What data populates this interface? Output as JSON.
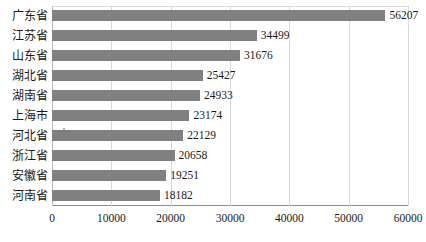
{
  "chart_data": {
    "type": "bar",
    "orientation": "horizontal",
    "title": "",
    "subtitle": "",
    "xlabel": "",
    "ylabel": "",
    "categories": [
      "广东省",
      "江苏省",
      "山东省",
      "湖北省",
      "湖南省",
      "上海市",
      "河北省",
      "浙江省",
      "安徽省",
      "河南省"
    ],
    "values": [
      56207,
      34499,
      31676,
      25427,
      24933,
      23174,
      22129,
      20658,
      19251,
      18182
    ],
    "data_labels": [
      "56207",
      "34499",
      "31676",
      "25427",
      "24933",
      "23174",
      "22129",
      "20658",
      "19251",
      "18182"
    ],
    "xlim": [
      0,
      60000
    ],
    "xticks": [
      0,
      10000,
      20000,
      30000,
      40000,
      50000,
      60000
    ],
    "xtick_labels": [
      "0",
      "10000",
      "20000",
      "30000",
      "40000",
      "50000",
      "60000"
    ],
    "grid": true,
    "grid_axis": "x",
    "legend": false,
    "legend_position": "none",
    "series": [
      {
        "name": "",
        "color": "#808080",
        "values": [
          56207,
          34499,
          31676,
          25427,
          24933,
          23174,
          22129,
          20658,
          19251,
          18182
        ]
      }
    ]
  },
  "style": {
    "bar_color": "#808080",
    "grid_color": "#d9d9d9",
    "axis_color": "#8c8c8c",
    "text_color": "#1a1a1a",
    "background": "#ffffff"
  }
}
